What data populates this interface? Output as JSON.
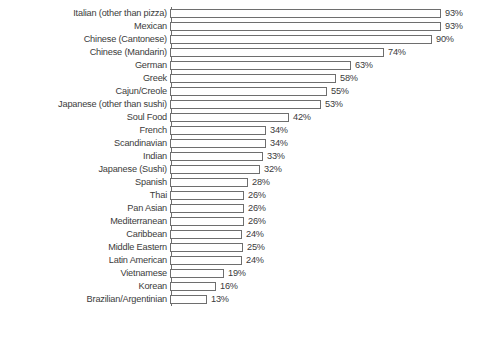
{
  "chart_data": {
    "type": "bar",
    "orientation": "horizontal",
    "title": "",
    "subtitle": "",
    "xlabel": "",
    "ylabel": "",
    "xlim": [
      0,
      100
    ],
    "grid": false,
    "legend": null,
    "value_suffix": "%",
    "axis_color": "#6e6e6e",
    "bar_fill": "#ffffff",
    "text_color": "#3b3b3b",
    "categories": [
      "Italian (other than pizza)",
      "Mexican",
      "Chinese (Cantonese)",
      "Chinese (Mandarin)",
      "German",
      "Greek",
      "Cajun/Creole",
      "Japanese (other than sushi)",
      "Soul Food",
      "French",
      "Scandinavian",
      "Indian",
      "Japanese (Sushi)",
      "Spanish",
      "Thai",
      "Pan Asian",
      "Mediterranean",
      "Caribbean",
      "Middle Eastern",
      "Latin American",
      "Vietnamese",
      "Korean",
      "Brazilian/Argentinian"
    ],
    "values": [
      93,
      93,
      90,
      74,
      63,
      58,
      55,
      53,
      42,
      34,
      34,
      33,
      32,
      28,
      26,
      26,
      26,
      24,
      25,
      24,
      19,
      16,
      13
    ],
    "value_labels": [
      "93%",
      "93%",
      "90%",
      "74%",
      "63%",
      "58%",
      "55%",
      "53%",
      "42%",
      "34%",
      "34%",
      "33%",
      "32%",
      "28%",
      "26%",
      "26%",
      "26%",
      "24%",
      "25%",
      "24%",
      "19%",
      "16%",
      "13%"
    ],
    "bar_pixel_lengths": [
      271,
      271,
      262,
      214,
      181,
      166,
      157,
      151,
      119,
      96,
      96,
      93,
      90,
      78,
      74,
      74,
      74,
      72,
      73,
      72,
      54,
      46,
      37
    ]
  }
}
